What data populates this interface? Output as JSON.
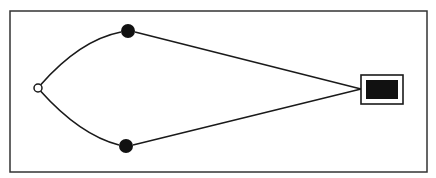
{
  "diagram": {
    "frame": {
      "x": 10,
      "y": 11,
      "width": 417,
      "height": 161,
      "stroke": "#333333"
    },
    "colors": {
      "line": "#1a1a1a",
      "fill_dark": "#111111",
      "background": "#ffffff"
    },
    "nodes": [
      {
        "id": "source",
        "shape": "open-circle",
        "cx": 38,
        "cy": 88,
        "r": 4
      },
      {
        "id": "upper",
        "shape": "filled-circle",
        "cx": 128,
        "cy": 31,
        "r": 7
      },
      {
        "id": "lower",
        "shape": "filled-circle",
        "cx": 126,
        "cy": 146,
        "r": 7
      },
      {
        "id": "target",
        "shape": "boxed-rectangle",
        "outer": {
          "x": 361,
          "y": 75,
          "width": 42,
          "height": 29
        },
        "inner": {
          "x": 366,
          "y": 80,
          "width": 32,
          "height": 19
        }
      }
    ],
    "edges": [
      {
        "from": "source",
        "to": "upper",
        "type": "curve"
      },
      {
        "from": "source",
        "to": "lower",
        "type": "curve"
      },
      {
        "from": "upper",
        "to": "target",
        "type": "straight"
      },
      {
        "from": "lower",
        "to": "target",
        "type": "straight"
      }
    ]
  }
}
